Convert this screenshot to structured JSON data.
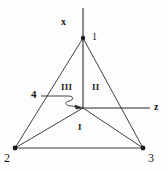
{
  "figure": {
    "background_color": "#fdfdfd",
    "stroke_color": "#2b2b2b",
    "axes": [
      {
        "name": "x",
        "label": "x",
        "orientation": "vertical-up"
      },
      {
        "name": "z",
        "label": "z",
        "orientation": "horizontal-right"
      }
    ],
    "vertices": [
      {
        "id": "1",
        "label": "1",
        "x": 83,
        "y": 38,
        "role": "apex"
      },
      {
        "id": "2",
        "label": "2",
        "x": 15,
        "y": 148,
        "role": "base-left"
      },
      {
        "id": "3",
        "label": "3",
        "x": 143,
        "y": 148,
        "role": "base-right"
      }
    ],
    "origin": {
      "label": "",
      "x": 83,
      "y": 108
    },
    "callouts": [
      {
        "id": "4",
        "label": "4",
        "points_to": "origin"
      }
    ],
    "regions": [
      {
        "id": "I",
        "label": "I",
        "x": 81,
        "y": 128
      },
      {
        "id": "II",
        "label": "II",
        "x": 96,
        "y": 88
      },
      {
        "id": "III",
        "label": "III",
        "x": 66,
        "y": 88
      }
    ]
  }
}
